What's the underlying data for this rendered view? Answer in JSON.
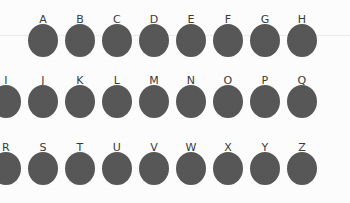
{
  "figure": {
    "background_color": "#fdfdfd",
    "spot_color": "#575757",
    "label_color": "#3a3a3a",
    "guide_line_color": "#ececec"
  },
  "chart_data": {
    "type": "scatter",
    "title": "",
    "xlabel": "",
    "ylabel": "",
    "grid": false,
    "legend": "none",
    "categories": [
      "A",
      "B",
      "C",
      "D",
      "E",
      "F",
      "G",
      "H",
      "I",
      "J",
      "K",
      "L",
      "M",
      "N",
      "O",
      "P",
      "Q",
      "R",
      "S",
      "T",
      "U",
      "V",
      "W",
      "X",
      "Y",
      "Z"
    ],
    "rows": [
      {
        "row_index": 1,
        "label_y": 14,
        "spot_top": 24,
        "spot_width": 30,
        "spot_height": 33,
        "items": [
          {
            "label": "A",
            "cx": 43
          },
          {
            "label": "B",
            "cx": 80
          },
          {
            "label": "C",
            "cx": 117
          },
          {
            "label": "D",
            "cx": 154
          },
          {
            "label": "E",
            "cx": 191
          },
          {
            "label": "F",
            "cx": 228
          },
          {
            "label": "G",
            "cx": 265
          },
          {
            "label": "H",
            "cx": 302
          }
        ]
      },
      {
        "row_index": 2,
        "label_y": 75,
        "spot_top": 85,
        "spot_width": 30,
        "spot_height": 33,
        "items": [
          {
            "label": "I",
            "cx": 6
          },
          {
            "label": "J",
            "cx": 43
          },
          {
            "label": "K",
            "cx": 80
          },
          {
            "label": "L",
            "cx": 117
          },
          {
            "label": "M",
            "cx": 154
          },
          {
            "label": "N",
            "cx": 191
          },
          {
            "label": "O",
            "cx": 228
          },
          {
            "label": "P",
            "cx": 265
          },
          {
            "label": "Q",
            "cx": 302
          }
        ]
      },
      {
        "row_index": 3,
        "label_y": 142,
        "spot_top": 152,
        "spot_width": 30,
        "spot_height": 33,
        "items": [
          {
            "label": "R",
            "cx": 6
          },
          {
            "label": "S",
            "cx": 43
          },
          {
            "label": "T",
            "cx": 80
          },
          {
            "label": "U",
            "cx": 117
          },
          {
            "label": "V",
            "cx": 154
          },
          {
            "label": "W",
            "cx": 191
          },
          {
            "label": "X",
            "cx": 228
          },
          {
            "label": "Y",
            "cx": 265
          },
          {
            "label": "Z",
            "cx": 302
          }
        ]
      }
    ],
    "guide_lines": [
      {
        "y": 35
      }
    ]
  }
}
